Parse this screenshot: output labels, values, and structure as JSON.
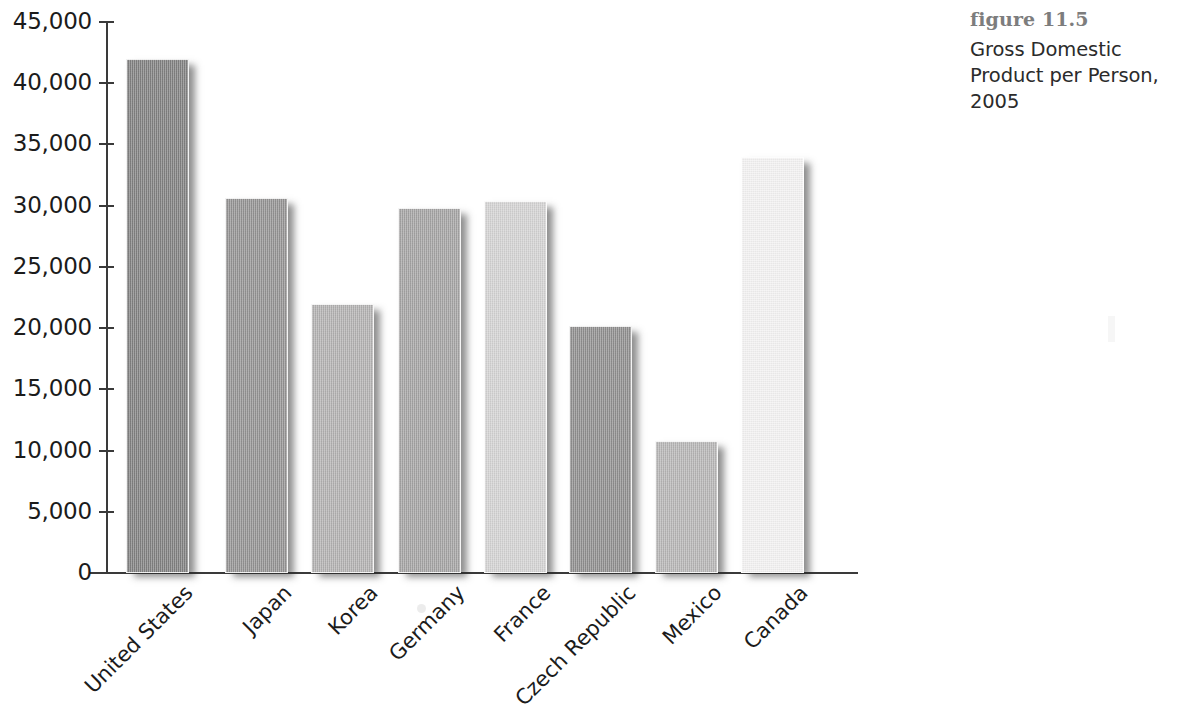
{
  "caption": {
    "figure_number": "figure 11.5",
    "description": "Gross Domestic Product per Person, 2005"
  },
  "axis": {
    "y_tick_labels": [
      "45,000",
      "40,000",
      "35,000",
      "30,000",
      "25,000",
      "20,000",
      "15,000",
      "10,000",
      "5,000",
      "0"
    ],
    "y_tick_values": [
      45000,
      40000,
      35000,
      30000,
      25000,
      20000,
      15000,
      10000,
      5000,
      0
    ]
  },
  "chart_data": {
    "type": "bar",
    "title": "Gross Domestic Product per Person, 2005",
    "subtitle": "figure 11.5",
    "xlabel": "",
    "ylabel": "",
    "ylim": [
      0,
      45000
    ],
    "ytick_step": 5000,
    "grid": false,
    "legend": null,
    "categories": [
      "United States",
      "Japan",
      "Korea",
      "Germany",
      "France",
      "Czech Republic",
      "Mexico",
      "Canada"
    ],
    "values": [
      42000,
      30600,
      22000,
      29800,
      30400,
      20200,
      10800,
      34000
    ],
    "bar_colors": [
      "#807f7f",
      "#929191",
      "#b1b0b0",
      "#a3a2a2",
      "#d2d1d1",
      "#8e8d8d",
      "#b5b4b4",
      "#f2f1f1"
    ]
  }
}
